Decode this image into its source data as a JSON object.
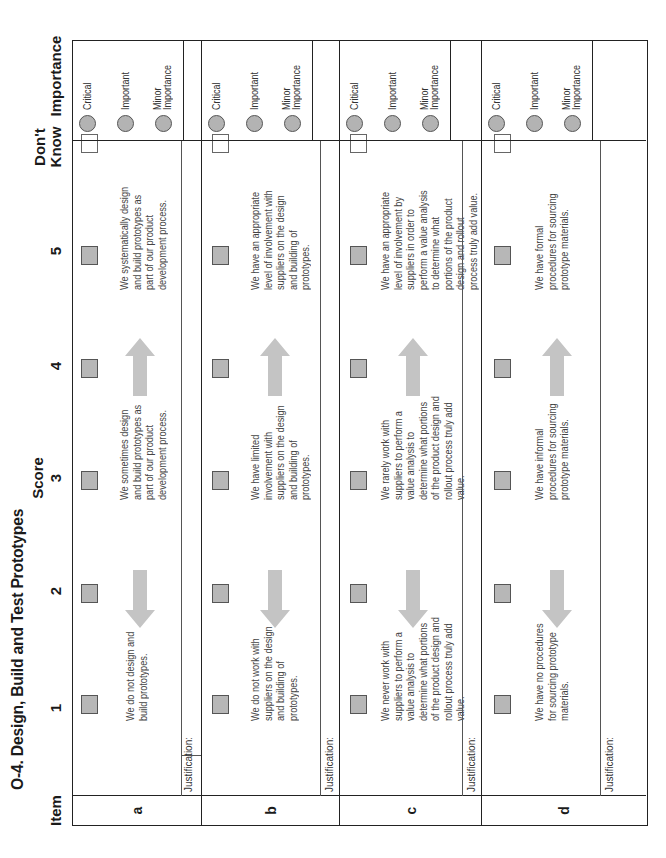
{
  "title": "O-4. Design, Build and Test Prototypes",
  "headers": {
    "item": "Item",
    "score": "Score",
    "score_columns": [
      "1",
      "2",
      "3",
      "4",
      "5"
    ],
    "dont_know_line1": "Don't",
    "dont_know_line2": "Know",
    "importance": "Importance"
  },
  "importance_options": [
    "Critical",
    "Important",
    "Minor Importance"
  ],
  "importance_option_lines": {
    "minor_line1": "Minor",
    "minor_line2": "Importance"
  },
  "justification_label": "Justification:",
  "rows": [
    {
      "item": "a",
      "score_1_text": "We do not design and build prototypes.",
      "score_3_text": "We sometimes design and build prototypes as part of our product development process.",
      "score_5_text": "We systematically design and build prototypes as part of our product development process."
    },
    {
      "item": "b",
      "score_1_text": "We do not work with suppliers on the design and building of prototypes.",
      "score_3_text": "We have limited involvement with suppliers on the design and building of prototypes.",
      "score_5_text": "We have an appropriate level of involvement with suppliers on the design and building of prototypes."
    },
    {
      "item": "c",
      "score_1_text": "We never work with suppliers to perform a value analysis to determine what portions of the product design and rollout process truly add value.",
      "score_3_text": "We rarely work with suppliers to perform a value analysis to determine what portions of the product design and rollout process truly add value.",
      "score_5_text": "We have an appropriate level of involvement by suppliers in order to perform a value analysis to determine what portions of the product design and rollout process truly add value."
    },
    {
      "item": "d",
      "score_1_text": "We have no procedures for sourcing prototype materials.",
      "score_3_text": "We have informal procedures for sourcing prototype materials.",
      "score_5_text": "We have formal procedures for sourcing prototype materials."
    }
  ],
  "colors": {
    "checkbox_fill": "#b7b7b7",
    "radio_fill": "#b3b3b3",
    "arrow_fill": "#c4c4c4",
    "border": "#222222"
  }
}
